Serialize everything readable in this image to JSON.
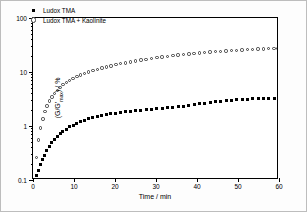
{
  "chart_data": {
    "type": "scatter",
    "title": "",
    "xlabel": "Time / min",
    "ylabel": "(G/G'max) / %",
    "ylabel_parts": {
      "prefix": "(G/G'",
      "sub": "max",
      "suffix": ") / %"
    },
    "xlim": [
      0,
      60
    ],
    "ylim": [
      0.1,
      100
    ],
    "yscale": "log",
    "xscale": "linear",
    "grid": false,
    "legend_position": "top-left",
    "xticks": [
      0,
      10,
      20,
      30,
      40,
      50,
      60
    ],
    "xtick_labels": [
      "0",
      "10",
      "20",
      "30",
      "40",
      "50",
      "60"
    ],
    "yticks": [
      0.1,
      1,
      10,
      100
    ],
    "ytick_labels": [
      "0.1",
      "1",
      "10",
      "100"
    ],
    "series": [
      {
        "name": "Ludox TMA",
        "marker": "filled-square",
        "color": "#000000",
        "x": [
          0.4,
          0.9,
          1.4,
          1.9,
          2.4,
          2.9,
          3.4,
          4.0,
          4.6,
          5.2,
          5.9,
          6.6,
          7.3,
          8.1,
          8.9,
          9.8,
          10.7,
          11.6,
          12.6,
          13.6,
          14.6,
          15.7,
          16.8,
          17.9,
          19.0,
          20.2,
          21.4,
          22.6,
          23.8,
          25.0,
          26.3,
          27.6,
          28.9,
          30.2,
          31.5,
          32.8,
          34.1,
          35.4,
          36.7,
          38.0,
          39.3,
          40.6,
          41.9,
          43.2,
          44.5,
          45.8,
          47.1,
          48.4,
          49.7,
          51.0,
          52.3,
          53.6,
          54.9,
          56.2,
          57.5,
          58.8,
          59.8
        ],
        "y": [
          0.1,
          0.12,
          0.15,
          0.19,
          0.24,
          0.29,
          0.35,
          0.42,
          0.49,
          0.56,
          0.64,
          0.72,
          0.8,
          0.88,
          0.96,
          1.04,
          1.12,
          1.2,
          1.28,
          1.35,
          1.42,
          1.49,
          1.55,
          1.61,
          1.67,
          1.73,
          1.78,
          1.83,
          1.87,
          1.91,
          1.95,
          1.99,
          2.03,
          2.07,
          2.11,
          2.16,
          2.21,
          2.27,
          2.34,
          2.41,
          2.49,
          2.57,
          2.65,
          2.73,
          2.81,
          2.88,
          2.94,
          3.0,
          3.05,
          3.09,
          3.13,
          3.17,
          3.2,
          3.23,
          3.26,
          3.29,
          3.32
        ]
      },
      {
        "name": "Ludox TMA + Kaolinite",
        "marker": "open-circle",
        "color": "#3a3a3a",
        "x": [
          0.4,
          0.9,
          1.4,
          1.9,
          2.4,
          2.9,
          3.4,
          4.0,
          4.6,
          5.2,
          5.9,
          6.6,
          7.3,
          8.1,
          8.9,
          9.8,
          10.7,
          11.6,
          12.6,
          13.6,
          14.6,
          15.7,
          16.8,
          17.9,
          19.0,
          20.2,
          21.4,
          22.6,
          23.8,
          25.0,
          26.3,
          27.6,
          28.9,
          30.2,
          31.5,
          32.8,
          34.1,
          35.4,
          36.7,
          38.0,
          39.3,
          40.6,
          41.9,
          43.2,
          44.5,
          45.8,
          47.1,
          48.4,
          49.7,
          51.0,
          52.3,
          53.6,
          54.9,
          56.2,
          57.5,
          58.8,
          59.8
        ],
        "y": [
          0.1,
          0.26,
          0.55,
          0.92,
          1.35,
          1.85,
          2.35,
          2.9,
          3.45,
          4.0,
          4.6,
          5.2,
          5.8,
          6.4,
          7.0,
          7.6,
          8.2,
          8.8,
          9.4,
          10.0,
          10.6,
          11.2,
          11.8,
          12.4,
          13.0,
          13.6,
          14.2,
          14.8,
          15.4,
          16.0,
          16.6,
          17.2,
          17.8,
          18.4,
          18.95,
          19.5,
          20.05,
          20.6,
          21.1,
          21.6,
          22.1,
          22.55,
          23.0,
          23.45,
          23.85,
          24.25,
          24.65,
          25.0,
          25.35,
          25.7,
          26.0,
          26.3,
          26.6,
          26.85,
          27.1,
          27.35,
          27.55
        ]
      }
    ]
  },
  "legend": {
    "items": [
      {
        "label": "Ludox TMA"
      },
      {
        "label": "Ludox TMA + Kaolinite"
      }
    ]
  }
}
